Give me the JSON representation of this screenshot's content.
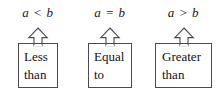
{
  "figure": {
    "background_color": "#ffffff",
    "line_color": "#4a4a50",
    "text_color": "#111114"
  },
  "columns": [
    {
      "id": "less",
      "relation": "a < b",
      "arrow": "up-arrow-icon",
      "box_line1": "Less",
      "box_line2": "than"
    },
    {
      "id": "equal",
      "relation": "a = b",
      "arrow": "up-arrow-icon",
      "box_line1": "Equal",
      "box_line2": "to"
    },
    {
      "id": "greater",
      "relation": "a > b",
      "arrow": "up-arrow-icon",
      "box_line1": "Greater",
      "box_line2": "than"
    }
  ]
}
